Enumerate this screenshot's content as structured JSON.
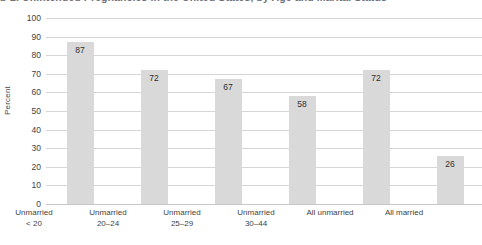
{
  "figure": {
    "title_cropped": "b-2. Unintended Pregnancies in the United States, by Age and Marital Status"
  },
  "chart_data": {
    "type": "bar",
    "title": "",
    "xlabel": "",
    "ylabel": "Percent",
    "ylim": [
      0,
      100
    ],
    "ytick_step": 10,
    "yticks": [
      "100",
      "90",
      "80",
      "70",
      "60",
      "50",
      "40",
      "30",
      "20",
      "10",
      "0"
    ],
    "grid": true,
    "legend": "none",
    "categories": [
      "Unmarried < 20",
      "Unmarried 20–24",
      "Unmarried 25–29",
      "Unmarried 30–44",
      "All unmarried",
      "All married"
    ],
    "category_lines": [
      [
        "Unmarried",
        "< 20"
      ],
      [
        "Unmarried",
        "20–24"
      ],
      [
        "Unmarried",
        "25–29"
      ],
      [
        "Unmarried",
        "30–44"
      ],
      [
        "All unmarried",
        ""
      ],
      [
        "All married",
        ""
      ]
    ],
    "values": [
      87,
      72,
      67,
      58,
      72,
      26
    ],
    "value_labels": [
      "87",
      "72",
      "67",
      "58",
      "72",
      "26"
    ],
    "bar_color": "#d9d9d9",
    "grid_color": "#d6d6d6",
    "text_color": "#3f3f3f"
  }
}
